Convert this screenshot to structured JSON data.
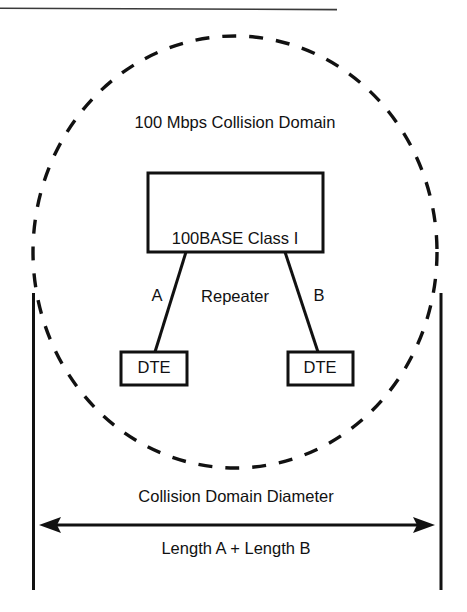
{
  "figure": {
    "title": "100 Mbps Collision Domain",
    "background_color": "#ffffff",
    "stroke_color": "#111111"
  },
  "collision_domain": {
    "boundary_style": "dashed-ellipse",
    "label": "100 Mbps Collision Domain"
  },
  "repeater": {
    "label_line1": "100BASE Class I",
    "label_line2": "Repeater",
    "shape": "rectangle"
  },
  "links": [
    {
      "id": "a",
      "label": "A",
      "from": "repeater",
      "to": "dte-left"
    },
    {
      "id": "b",
      "label": "B",
      "from": "repeater",
      "to": "dte-right"
    }
  ],
  "nodes": [
    {
      "id": "dte-left",
      "label": "DTE",
      "shape": "rectangle"
    },
    {
      "id": "dte-right",
      "label": "DTE",
      "shape": "rectangle"
    }
  ],
  "measurement": {
    "caption_above": "Collision Domain Diameter",
    "caption_below": "Length A + Length B",
    "arrow_style": "double-headed",
    "left_boundary_marker": "vertical-rule",
    "right_boundary_marker": "vertical-rule"
  },
  "page_rule": {
    "position": "top",
    "style": "thin-horizontal-line"
  }
}
